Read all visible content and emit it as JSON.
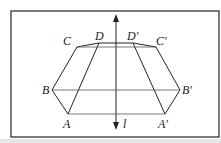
{
  "figure": {
    "axis_label": "l",
    "points": {
      "A": "A",
      "B": "B",
      "C": "C",
      "D": "D",
      "A_prime": "A′",
      "B_prime": "B′",
      "C_prime": "C′",
      "D_prime": "D′"
    },
    "colors": {
      "line": "#222222",
      "background": "#ffffff"
    }
  }
}
